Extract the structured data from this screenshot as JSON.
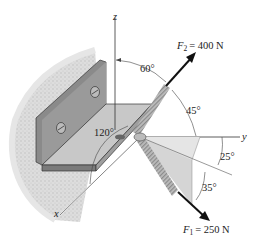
{
  "diagram": {
    "type": "3D force diagram",
    "axes": {
      "x": "x",
      "y": "y",
      "z": "z"
    },
    "forces": [
      {
        "id": "F2",
        "symbol": "F",
        "subscript": "2",
        "value_text": "= 400 N",
        "magnitude": 400,
        "unit": "N"
      },
      {
        "id": "F1",
        "symbol": "F",
        "subscript": "1",
        "value_text": "= 250 N",
        "magnitude": 250,
        "unit": "N"
      }
    ],
    "angles": [
      {
        "id": "angle-60",
        "label": "60°",
        "between": "z-axis and F2"
      },
      {
        "id": "angle-45",
        "label": "45°",
        "between": "F2 and y-axis"
      },
      {
        "id": "angle-120",
        "label": "120°",
        "between": "x-axis and F2"
      },
      {
        "id": "angle-25",
        "label": "25°",
        "between": "y-axis and F1 projection"
      },
      {
        "id": "angle-35",
        "label": "35°",
        "between": "F1 projection and F1"
      }
    ],
    "colors": {
      "bracket_dark": "#7d7d7d",
      "bracket_mid": "#a9a9a9",
      "bracket_light": "#c9c9c9",
      "wall_texture": "#cfcfcf",
      "axis_line": "#333333",
      "arrow": "#111111",
      "plane_fill": "#e3e3e3"
    }
  }
}
